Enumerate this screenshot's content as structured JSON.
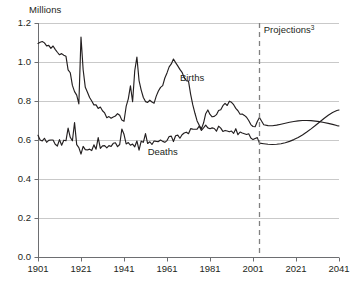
{
  "chart_data": {
    "type": "line",
    "title": "",
    "subtitle": "",
    "unit_label": "Millions",
    "xlabel": "",
    "ylabel": "Millions",
    "xlim": [
      1901,
      2041
    ],
    "ylim": [
      0.0,
      1.2
    ],
    "grid": true,
    "grid_axis": "y",
    "legend_position": "inline-annotation",
    "x_tick_labels": [
      "1901",
      "1921",
      "1941",
      "1961",
      "1981",
      "2001",
      "2021",
      "2041"
    ],
    "x_ticks": [
      1901,
      1921,
      1941,
      1961,
      1981,
      2001,
      2021,
      2041
    ],
    "y_tick_labels": [
      "0.0",
      "0.2",
      "0.4",
      "0.6",
      "0.8",
      "1.0",
      "1.2"
    ],
    "y_ticks": [
      0.0,
      0.2,
      0.4,
      0.6,
      0.8,
      1.0,
      1.2
    ],
    "annotations": [
      {
        "text": "Projections",
        "superscript": "3",
        "x": 2006,
        "y": 1.15
      },
      {
        "text": "Births",
        "x": 1967,
        "y": 0.905
      },
      {
        "text": "Deaths",
        "x": 1952,
        "y": 0.525
      }
    ],
    "projection_divider": {
      "x": 2004,
      "style": "dashed",
      "color": "#808080"
    },
    "series": [
      {
        "name": "Births",
        "color": "#231f20",
        "x": [
          1901,
          1902,
          1903,
          1904,
          1905,
          1906,
          1907,
          1908,
          1909,
          1910,
          1911,
          1912,
          1913,
          1914,
          1915,
          1916,
          1917,
          1918,
          1919,
          1920,
          1921,
          1922,
          1923,
          1924,
          1925,
          1926,
          1927,
          1928,
          1929,
          1930,
          1931,
          1932,
          1933,
          1934,
          1935,
          1936,
          1937,
          1938,
          1939,
          1940,
          1941,
          1942,
          1943,
          1944,
          1945,
          1946,
          1947,
          1948,
          1949,
          1950,
          1951,
          1952,
          1953,
          1954,
          1955,
          1956,
          1957,
          1958,
          1959,
          1960,
          1961,
          1962,
          1963,
          1964,
          1965,
          1966,
          1967,
          1968,
          1969,
          1970,
          1971,
          1972,
          1973,
          1974,
          1975,
          1976,
          1977,
          1978,
          1979,
          1980,
          1981,
          1982,
          1983,
          1984,
          1985,
          1986,
          1987,
          1988,
          1989,
          1990,
          1991,
          1992,
          1993,
          1994,
          1995,
          1996,
          1997,
          1998,
          1999,
          2000,
          2001,
          2002,
          2003,
          2004
        ],
        "values": [
          1.095,
          1.101,
          1.105,
          1.098,
          1.083,
          1.085,
          1.07,
          1.082,
          1.065,
          1.05,
          1.037,
          1.043,
          1.035,
          1.03,
          0.96,
          0.945,
          0.88,
          0.848,
          0.83,
          0.785,
          1.128,
          0.96,
          0.87,
          0.845,
          0.818,
          0.8,
          0.78,
          0.78,
          0.762,
          0.769,
          0.75,
          0.739,
          0.714,
          0.72,
          0.712,
          0.718,
          0.723,
          0.735,
          0.727,
          0.702,
          0.696,
          0.772,
          0.811,
          0.878,
          0.796,
          0.955,
          1.025,
          0.905,
          0.856,
          0.818,
          0.797,
          0.793,
          0.804,
          0.795,
          0.789,
          0.825,
          0.851,
          0.87,
          0.879,
          0.918,
          0.944,
          0.975,
          0.99,
          1.015,
          0.997,
          0.98,
          0.962,
          0.947,
          0.92,
          0.904,
          0.902,
          0.834,
          0.78,
          0.737,
          0.698,
          0.675,
          0.657,
          0.687,
          0.735,
          0.754,
          0.731,
          0.719,
          0.721,
          0.73,
          0.751,
          0.755,
          0.776,
          0.788,
          0.777,
          0.799,
          0.793,
          0.781,
          0.762,
          0.75,
          0.732,
          0.733,
          0.726,
          0.717,
          0.7,
          0.679,
          0.669,
          0.668,
          0.695,
          0.715
        ]
      },
      {
        "name": "Births (projected)",
        "color": "#231f20",
        "projection": true,
        "x": [
          2004,
          2006,
          2008,
          2010,
          2012,
          2014,
          2016,
          2018,
          2020,
          2022,
          2024,
          2026,
          2028,
          2030,
          2032,
          2034,
          2036,
          2038,
          2040,
          2041
        ],
        "values": [
          0.715,
          0.678,
          0.674,
          0.673,
          0.676,
          0.681,
          0.686,
          0.691,
          0.695,
          0.698,
          0.7,
          0.7,
          0.699,
          0.697,
          0.694,
          0.69,
          0.685,
          0.68,
          0.674,
          0.672
        ]
      },
      {
        "name": "Deaths",
        "color": "#231f20",
        "x": [
          1901,
          1902,
          1903,
          1904,
          1905,
          1906,
          1907,
          1908,
          1909,
          1910,
          1911,
          1912,
          1913,
          1914,
          1915,
          1916,
          1917,
          1918,
          1919,
          1920,
          1921,
          1922,
          1923,
          1924,
          1925,
          1926,
          1927,
          1928,
          1929,
          1930,
          1931,
          1932,
          1933,
          1934,
          1935,
          1936,
          1937,
          1938,
          1939,
          1940,
          1941,
          1942,
          1943,
          1944,
          1945,
          1946,
          1947,
          1948,
          1949,
          1950,
          1951,
          1952,
          1953,
          1954,
          1955,
          1956,
          1957,
          1958,
          1959,
          1960,
          1961,
          1962,
          1963,
          1964,
          1965,
          1966,
          1967,
          1968,
          1969,
          1970,
          1971,
          1972,
          1973,
          1974,
          1975,
          1976,
          1977,
          1978,
          1979,
          1980,
          1981,
          1982,
          1983,
          1984,
          1985,
          1986,
          1987,
          1988,
          1989,
          1990,
          1991,
          1992,
          1993,
          1994,
          1995,
          1996,
          1997,
          1998,
          1999,
          2000,
          2001,
          2002,
          2003,
          2004
        ],
        "values": [
          0.624,
          0.6,
          0.595,
          0.609,
          0.588,
          0.598,
          0.6,
          0.6,
          0.578,
          0.569,
          0.602,
          0.573,
          0.599,
          0.596,
          0.661,
          0.614,
          0.596,
          0.689,
          0.576,
          0.561,
          0.528,
          0.567,
          0.551,
          0.549,
          0.553,
          0.546,
          0.575,
          0.553,
          0.612,
          0.557,
          0.57,
          0.571,
          0.56,
          0.571,
          0.567,
          0.583,
          0.586,
          0.566,
          0.577,
          0.656,
          0.629,
          0.58,
          0.587,
          0.573,
          0.579,
          0.565,
          0.595,
          0.548,
          0.594,
          0.588,
          0.633,
          0.582,
          0.591,
          0.577,
          0.595,
          0.593,
          0.592,
          0.6,
          0.593,
          0.588,
          0.597,
          0.618,
          0.62,
          0.592,
          0.622,
          0.625,
          0.609,
          0.627,
          0.636,
          0.64,
          0.632,
          0.658,
          0.656,
          0.655,
          0.656,
          0.671,
          0.649,
          0.662,
          0.676,
          0.662,
          0.658,
          0.662,
          0.659,
          0.645,
          0.671,
          0.661,
          0.644,
          0.649,
          0.646,
          0.642,
          0.646,
          0.634,
          0.658,
          0.627,
          0.641,
          0.636,
          0.632,
          0.628,
          0.632,
          0.61,
          0.602,
          0.608,
          0.612,
          0.584
        ]
      },
      {
        "name": "Deaths (projected)",
        "color": "#231f20",
        "projection": true,
        "x": [
          2004,
          2006,
          2008,
          2010,
          2012,
          2014,
          2016,
          2018,
          2020,
          2022,
          2024,
          2026,
          2028,
          2030,
          2032,
          2034,
          2036,
          2038,
          2040,
          2041
        ],
        "values": [
          0.584,
          0.581,
          0.578,
          0.577,
          0.578,
          0.581,
          0.586,
          0.593,
          0.602,
          0.613,
          0.626,
          0.641,
          0.657,
          0.674,
          0.692,
          0.71,
          0.727,
          0.741,
          0.751,
          0.754
        ]
      }
    ]
  },
  "colors": {
    "line": "#231f20",
    "grid": "#c9c9c9",
    "axis": "#6d6e71",
    "projection_divider": "#808080",
    "text": "#231f20",
    "background": "#ffffff"
  }
}
